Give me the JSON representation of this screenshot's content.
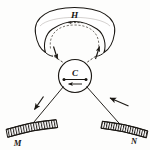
{
  "figure": {
    "kind": "line-diagram",
    "background_color": "#fdfdfc",
    "ink_color": "#1a1713",
    "labels": {
      "horseshoe_band": "H",
      "center_circle": "C",
      "left_bar": "M",
      "right_bar": "N"
    },
    "elements": [
      {
        "name": "horseshoe-band",
        "label": "H",
        "description": "broad curved band at top, open downward, with dashed inner outline"
      },
      {
        "name": "center-circle",
        "label": "C",
        "description": "circle at center containing a horizontal dotted rod and a leftward arrow"
      },
      {
        "name": "left-bar",
        "label": "M",
        "description": "hatched bar at lower left, tilted up to the right"
      },
      {
        "name": "right-bar",
        "label": "N",
        "description": "hatched bar at lower right, tilted up to the left"
      }
    ],
    "arrows": [
      {
        "name": "band-inner-arrow",
        "direction": "left",
        "style": "dashed"
      },
      {
        "name": "left-ray-arrow",
        "direction": "down",
        "style": "solid"
      },
      {
        "name": "right-ray-arrow",
        "direction": "up",
        "style": "solid"
      },
      {
        "name": "circle-inner-arrow",
        "direction": "left",
        "style": "solid"
      },
      {
        "name": "lower-left-arrow",
        "direction": "down-left",
        "style": "solid"
      },
      {
        "name": "lower-right-arrow",
        "direction": "up-left",
        "style": "solid"
      }
    ]
  }
}
